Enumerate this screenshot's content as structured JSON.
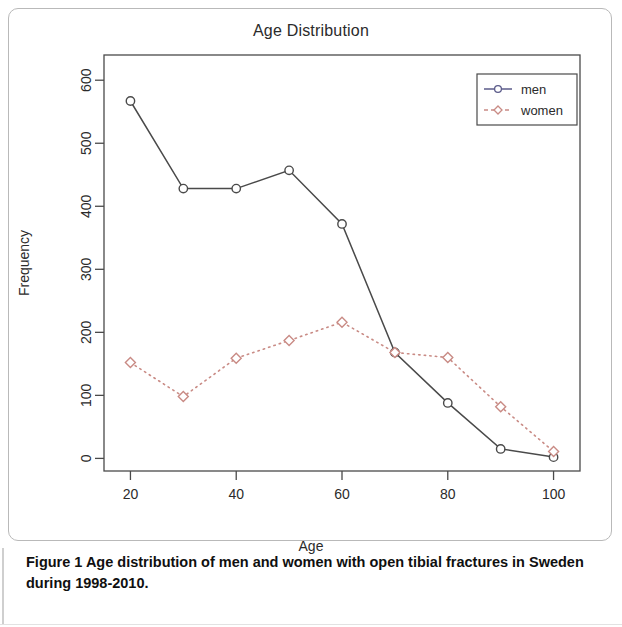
{
  "figure": {
    "caption_label": "Figure 1",
    "caption_text": " Age distribution of men and women with open tibial fractures in Sweden during 1998-2010."
  },
  "chart_data": {
    "type": "line",
    "title": "Age Distribution",
    "xlabel": "Age",
    "ylabel": "Frequency",
    "x": [
      20,
      30,
      40,
      50,
      60,
      70,
      80,
      90,
      100
    ],
    "xticks": [
      20,
      40,
      60,
      80,
      100
    ],
    "yticks": [
      0,
      100,
      200,
      300,
      400,
      500,
      600
    ],
    "xlim": [
      15,
      105
    ],
    "ylim": [
      -20,
      640
    ],
    "grid": false,
    "legend_position": "top-right",
    "series": [
      {
        "name": "men",
        "values": [
          567,
          428,
          428,
          457,
          372,
          168,
          88,
          15,
          2
        ],
        "color": "#5b5b8a",
        "line_color": "#4a4a4a",
        "line_style": "solid",
        "marker": "circle"
      },
      {
        "name": "women",
        "values": [
          152,
          98,
          159,
          187,
          216,
          168,
          160,
          82,
          11
        ],
        "color": "#c98b85",
        "line_color": "#c98b85",
        "line_style": "dotted",
        "marker": "diamond"
      }
    ]
  },
  "legend": {
    "entries": [
      {
        "label": "men"
      },
      {
        "label": "women"
      }
    ]
  }
}
